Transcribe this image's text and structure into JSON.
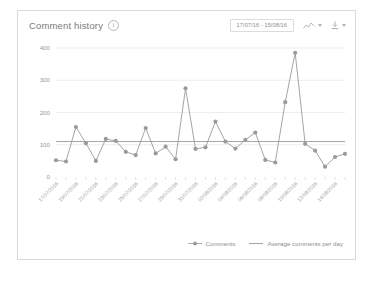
{
  "card": {
    "title": "Comment history",
    "info_icon": "info-icon",
    "date_range": "17/07/16 - 15/08/16",
    "chart_type_icon": "line-chart-icon",
    "download_icon": "download-icon"
  },
  "legend": [
    {
      "label": "Comments",
      "marker": "point",
      "color": "#9a9a9a"
    },
    {
      "label": "Average comments per day",
      "marker": "line",
      "color": "#a8a8a8"
    }
  ],
  "colors": {
    "series": "#9a9a9a",
    "average_line": "#a6a6a6",
    "grid": "#ededed",
    "axis_text": "#9a9a9a",
    "border": "#d9d9d9"
  },
  "chart_data": {
    "type": "line",
    "title": "Comment history",
    "xlabel": "",
    "ylabel": "",
    "ylim": [
      0,
      400
    ],
    "yticks": [
      0,
      100,
      200,
      300,
      400
    ],
    "grid": true,
    "legend_position": "bottom-right",
    "categories": [
      "17/07/2016",
      "18/07/2016",
      "19/07/2016",
      "20/07/2016",
      "21/07/2016",
      "22/07/2016",
      "23/07/2016",
      "24/07/2016",
      "25/07/2016",
      "26/07/2016",
      "27/07/2016",
      "28/07/2016",
      "29/07/2016",
      "30/07/2016",
      "31/07/2016",
      "01/08/2016",
      "02/08/2016",
      "03/08/2016",
      "04/08/2016",
      "05/08/2016",
      "06/08/2016",
      "07/08/2016",
      "08/08/2016",
      "09/08/2016",
      "10/08/2016",
      "11/08/2016",
      "12/08/2016",
      "13/08/2016",
      "14/08/2016",
      "15/08/2016"
    ],
    "tick_labels": [
      "17/07/2016",
      "19/07/2016",
      "21/07/2016",
      "23/07/2016",
      "25/07/2016",
      "27/07/2016",
      "29/07/2016",
      "31/07/2016",
      "02/08/2016",
      "04/08/2016",
      "06/08/2016",
      "08/08/2016",
      "10/08/2016",
      "12/08/2016",
      "14/08/2016"
    ],
    "series": [
      {
        "name": "Comments",
        "type": "line",
        "values": [
          52,
          48,
          155,
          105,
          50,
          118,
          112,
          78,
          68,
          152,
          73,
          94,
          55,
          275,
          87,
          92,
          172,
          110,
          88,
          115,
          138,
          53,
          45,
          232,
          385,
          103,
          82,
          32,
          62,
          72
        ]
      },
      {
        "name": "Average comments per day",
        "type": "average-line",
        "value": 110
      }
    ]
  }
}
